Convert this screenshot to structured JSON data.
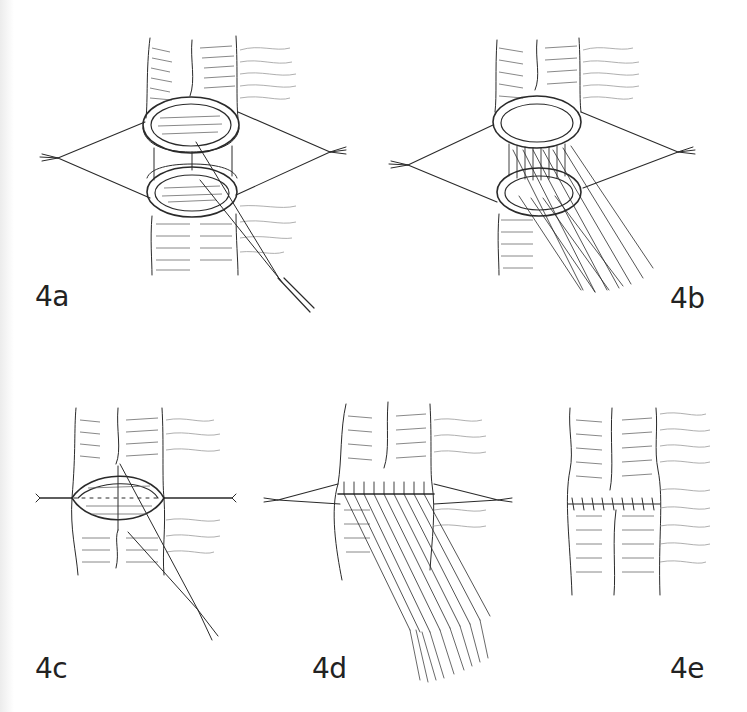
{
  "figure": {
    "panels": [
      {
        "id": "4a",
        "label": "4a",
        "content": "Two bowel ends held open by stay sutures; first suture placed with needle"
      },
      {
        "id": "4b",
        "label": "4b",
        "content": "Row of interrupted sutures placed across the posterior wall between the two ends"
      },
      {
        "id": "4c",
        "label": "4c",
        "content": "Bowel ends approximated; stay sutures horizontal; anterior suture being placed"
      },
      {
        "id": "4d",
        "label": "4d",
        "content": "Multiple anterior sutures placed before tying"
      },
      {
        "id": "4e",
        "label": "4e",
        "content": "Completed anastomosis with a row of tied sutures"
      }
    ]
  },
  "colors": {
    "background": "#ffffff",
    "ink": "#2a2a2a",
    "label": "#222222"
  }
}
